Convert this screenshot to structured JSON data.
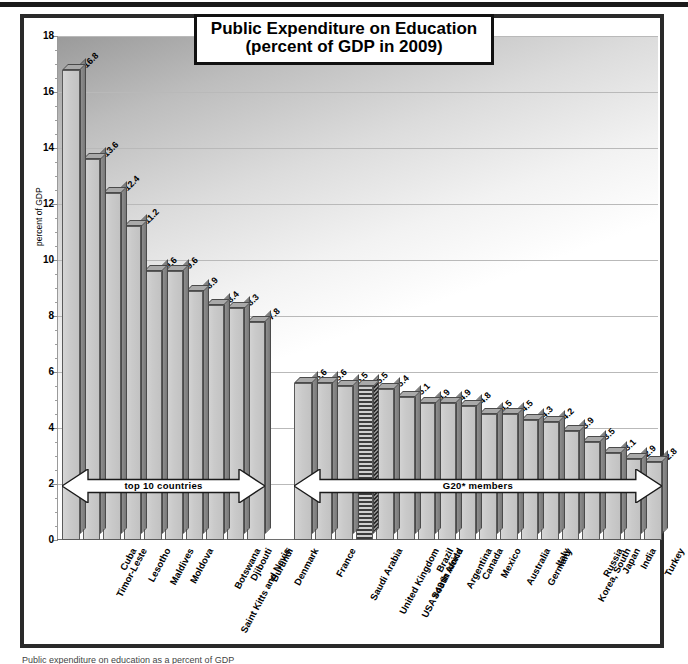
{
  "chart_data": {
    "type": "bar",
    "title": "Public Expenditure on Education",
    "subtitle": "(percent of GDP in 2009)",
    "ylabel": "percent of GDP",
    "xlabel": "",
    "ylim": [
      0,
      18
    ],
    "ytick_step": 2,
    "yticks": [
      "0",
      "2",
      "4",
      "6",
      "8",
      "10",
      "12",
      "14",
      "16",
      "18"
    ],
    "grid": true,
    "legend": "none",
    "groups": [
      {
        "name": "top 10 countries",
        "annotation": "top 10 countries",
        "categories": [
          "Timor-Leste",
          "Cuba",
          "Lesotho",
          "Maldives",
          "Moldova",
          "Saint Kitts and Nevis",
          "Botswana",
          "Djibouti",
          "Burundi",
          "Denmark"
        ],
        "values": [
          16.8,
          13.6,
          12.4,
          11.2,
          9.6,
          9.6,
          8.9,
          8.4,
          8.3,
          7.8
        ]
      },
      {
        "name": "G20* members",
        "annotation": "G20* members",
        "categories": [
          "France",
          "Saudi Arabia",
          "United Kingdom",
          "USA #43 in world",
          "South Africa",
          "Brazil",
          "Argentina",
          "Canada",
          "Mexico",
          "Australia",
          "Germany",
          "Italy",
          "Korea, South",
          "Russia",
          "Japan",
          "India",
          "Turkey",
          "Indonesia"
        ],
        "values": [
          5.6,
          5.6,
          5.5,
          5.5,
          5.4,
          5.1,
          4.9,
          4.9,
          4.8,
          4.5,
          4.5,
          4.3,
          4.2,
          3.9,
          3.5,
          3.1,
          2.9,
          2.8
        ],
        "highlight_index": 3
      }
    ]
  },
  "footnote": "Public expenditure on education as a percent of GDP",
  "colors": {
    "bar_front": "#c8c8c8",
    "bar_side": "#808080",
    "bar_top": "#a9a9a9",
    "border": "#2a2a2a",
    "text": "#000000",
    "gridline": "#b9b9b9"
  }
}
